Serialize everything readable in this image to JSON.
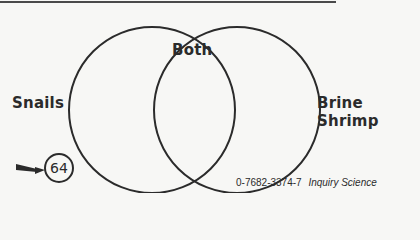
{
  "diagram": {
    "type": "venn",
    "sets": [
      {
        "label": "Snails",
        "position": "left"
      },
      {
        "label": "Brine Shrimp",
        "position": "right"
      }
    ],
    "intersection_label": "Both"
  },
  "page": {
    "number": "64"
  },
  "footer": {
    "isbn": "0-7682-3374-7",
    "publication": "Inquiry Science"
  },
  "colors": {
    "ink": "#2b2b2b",
    "paper": "#f7f7f5"
  }
}
